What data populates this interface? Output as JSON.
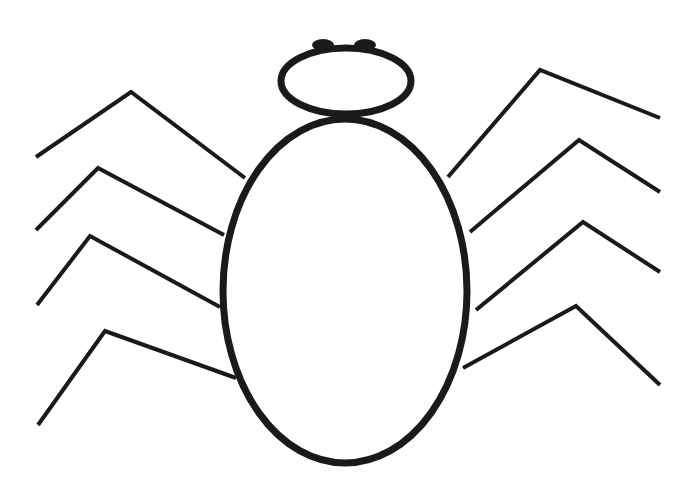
{
  "drawing": {
    "subject": "spider line drawing",
    "stroke_color": "#1a1a1a",
    "background": "#ffffff",
    "body": {
      "cx": 345,
      "cy": 291,
      "rx": 122,
      "ry": 172,
      "stroke_width": 7
    },
    "head": {
      "cx": 346,
      "cy": 81,
      "rx": 65,
      "ry": 33,
      "stroke_width": 7
    },
    "eyes": [
      {
        "cx": 323,
        "cy": 45,
        "rx": 11,
        "ry": 6
      },
      {
        "cx": 365,
        "cy": 45,
        "rx": 11,
        "ry": 6
      }
    ],
    "legs": [
      {
        "side": "left",
        "points": "36,157 131,92 245,178"
      },
      {
        "side": "left",
        "points": "36,230 98,168 224,235"
      },
      {
        "side": "left",
        "points": "37,305 90,236 220,307"
      },
      {
        "side": "left",
        "points": "38,425 105,331 236,378"
      },
      {
        "side": "right",
        "points": "448,177 540,70 660,118"
      },
      {
        "side": "right",
        "points": "470,232 579,140 660,192"
      },
      {
        "side": "right",
        "points": "476,310 583,222 660,272"
      },
      {
        "side": "right",
        "points": "463,368 576,306 660,385"
      }
    ],
    "leg_stroke_width": 4
  }
}
